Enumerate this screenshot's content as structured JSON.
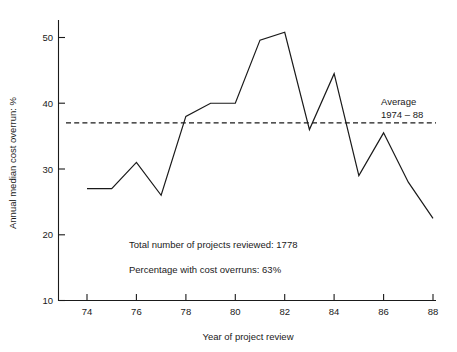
{
  "chart_data": {
    "type": "line",
    "title": "",
    "xlabel": "Year of project review",
    "ylabel": "Annual median cost overrun: %",
    "xlim": [
      73,
      88
    ],
    "ylim": [
      10,
      52
    ],
    "grid": false,
    "legend": "none",
    "x": [
      74,
      75,
      76,
      77,
      78,
      79,
      80,
      81,
      82,
      83,
      84,
      85,
      86,
      87,
      88
    ],
    "xtick_labels": [
      "74",
      "76",
      "78",
      "80",
      "82",
      "84",
      "86",
      "88"
    ],
    "xticks": [
      74,
      76,
      78,
      80,
      82,
      84,
      86,
      88
    ],
    "ytick_labels": [
      "10",
      "20",
      "30",
      "40",
      "50"
    ],
    "yticks": [
      10,
      20,
      30,
      40,
      50
    ],
    "series": [
      {
        "name": "Annual median cost overrun",
        "values": [
          27,
          27,
          31,
          26,
          38,
          40,
          40,
          49.6,
          50.8,
          36,
          44.5,
          29,
          35.5,
          28,
          22.5
        ]
      }
    ],
    "reference_line": {
      "name": "Average 1974 - 88",
      "value": 37,
      "style": "dashed",
      "label_line1": "Average",
      "label_line2": "1974 – 88"
    },
    "annotations": [
      "Total number of projects reviewed: 1778",
      "Percentage with cost overruns: 63%"
    ]
  },
  "axes": {
    "x_title": "Year of project review",
    "y_title": "Annual median cost overrun: %"
  },
  "annotations": {
    "total_projects": "Total number of projects reviewed: 1778",
    "percentage_overruns": "Percentage with cost overruns: 63%",
    "average_label_1": "Average",
    "average_label_2": "1974 – 88"
  },
  "ticks": {
    "x": [
      "74",
      "76",
      "78",
      "80",
      "82",
      "84",
      "86",
      "88"
    ],
    "y": [
      "10",
      "20",
      "30",
      "40",
      "50"
    ]
  },
  "colors": {
    "ink": "#1a1a1a",
    "background": "#ffffff"
  }
}
